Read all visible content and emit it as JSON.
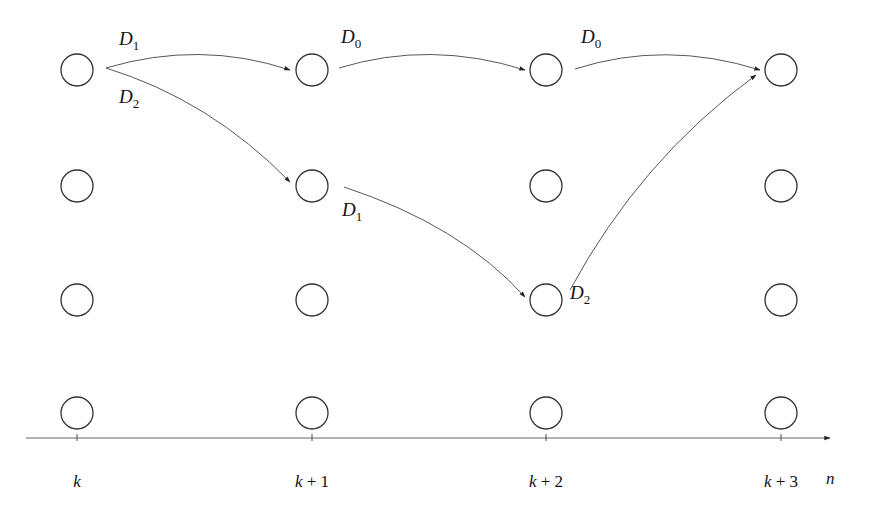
{
  "diagram": {
    "type": "trellis-state-transition",
    "columns": [
      {
        "label_var": "k",
        "label_rest": "",
        "x": 77
      },
      {
        "label_var": "k",
        "label_rest": " + 1",
        "x": 312
      },
      {
        "label_var": "k",
        "label_rest": " + 2",
        "x": 546
      },
      {
        "label_var": "k",
        "label_rest": " + 3",
        "x": 781
      }
    ],
    "rows_y": [
      70,
      186,
      300,
      413
    ],
    "node_radius": 16,
    "axis": {
      "label": "n",
      "y": 438
    },
    "edges": [
      {
        "from": [
          0,
          0
        ],
        "to": [
          1,
          0
        ],
        "label": "D",
        "sub": "1"
      },
      {
        "from": [
          0,
          0
        ],
        "to": [
          1,
          1
        ],
        "label": "D",
        "sub": "2"
      },
      {
        "from": [
          1,
          0
        ],
        "to": [
          2,
          0
        ],
        "label": "D",
        "sub": "0"
      },
      {
        "from": [
          2,
          0
        ],
        "to": [
          3,
          0
        ],
        "label": "D",
        "sub": "0"
      },
      {
        "from": [
          1,
          1
        ],
        "to": [
          2,
          2
        ],
        "label": "D",
        "sub": "1"
      },
      {
        "from": [
          2,
          2
        ],
        "to": [
          3,
          0
        ],
        "label": "D",
        "sub": "2"
      }
    ]
  },
  "labels": {
    "e1": {
      "D": "D",
      "sub": "1"
    },
    "e2": {
      "D": "D",
      "sub": "2"
    },
    "e3": {
      "D": "D",
      "sub": "0"
    },
    "e4": {
      "D": "D",
      "sub": "0"
    },
    "e5": {
      "D": "D",
      "sub": "1"
    },
    "e6": {
      "D": "D",
      "sub": "2"
    },
    "ticks": [
      "k",
      "k + 1",
      "k + 2",
      "k + 3"
    ],
    "axis_n": "n"
  }
}
